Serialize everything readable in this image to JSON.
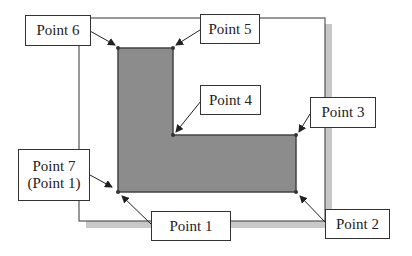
{
  "diagram": {
    "colors": {
      "background": "#ffffff",
      "frame_border": "#555555",
      "frame_shadow": "#c8c8c8",
      "shape_fill": "#8c8c8c",
      "shape_stroke": "#444444",
      "label_border": "#333333",
      "text": "#222222"
    },
    "labels": {
      "point6": "Point 6",
      "point5": "Point 5",
      "point4": "Point 4",
      "point3": "Point 3",
      "point7_line1": "Point 7",
      "point7_line2": "(Point 1)",
      "point1": "Point 1",
      "point2": "Point 2"
    },
    "vertices": [
      {
        "name": "Point 1",
        "x": 118,
        "y": 192
      },
      {
        "name": "Point 2",
        "x": 296,
        "y": 192
      },
      {
        "name": "Point 3",
        "x": 296,
        "y": 135
      },
      {
        "name": "Point 4",
        "x": 173,
        "y": 135
      },
      {
        "name": "Point 5",
        "x": 173,
        "y": 48
      },
      {
        "name": "Point 6",
        "x": 118,
        "y": 48
      },
      {
        "name": "Point 7",
        "x": 118,
        "y": 192
      }
    ]
  }
}
